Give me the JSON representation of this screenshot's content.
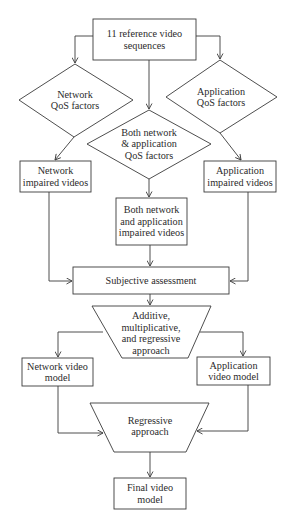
{
  "diagram": {
    "nodes": {
      "reference": {
        "shape": "rectangle",
        "lines": [
          "11 reference video",
          "sequences"
        ]
      },
      "network_qos": {
        "shape": "diamond",
        "lines": [
          "Network",
          "QoS factors"
        ]
      },
      "application_qos": {
        "shape": "diamond",
        "lines": [
          "Application",
          "QoS factors"
        ]
      },
      "both_qos": {
        "shape": "diamond",
        "lines": [
          "Both network",
          "& application",
          "QoS factors"
        ]
      },
      "network_impaired": {
        "shape": "rectangle",
        "lines": [
          "Network",
          "impaired videos"
        ]
      },
      "application_impaired": {
        "shape": "rectangle",
        "lines": [
          "Application",
          "impaired videos"
        ]
      },
      "both_impaired": {
        "shape": "rectangle",
        "lines": [
          "Both network",
          "and application",
          "impaired videos"
        ]
      },
      "subjective": {
        "shape": "rectangle",
        "lines": [
          "Subjective assessment"
        ]
      },
      "additive": {
        "shape": "trapezoid",
        "lines": [
          "Additive,",
          "multiplicative,",
          "and regressive",
          "approach"
        ]
      },
      "network_model": {
        "shape": "rectangle",
        "lines": [
          "Network video",
          "model"
        ]
      },
      "application_model": {
        "shape": "rectangle",
        "lines": [
          "Application",
          "video model"
        ]
      },
      "regressive": {
        "shape": "trapezoid",
        "lines": [
          "Regressive",
          "approach"
        ]
      },
      "final": {
        "shape": "rectangle",
        "lines": [
          "Final video",
          "model"
        ]
      }
    },
    "edges": [
      [
        "reference",
        "network_qos"
      ],
      [
        "reference",
        "both_qos"
      ],
      [
        "reference",
        "application_qos"
      ],
      [
        "network_qos",
        "network_impaired"
      ],
      [
        "both_qos",
        "both_impaired"
      ],
      [
        "application_qos",
        "application_impaired"
      ],
      [
        "network_impaired",
        "subjective"
      ],
      [
        "both_impaired",
        "subjective"
      ],
      [
        "application_impaired",
        "subjective"
      ],
      [
        "subjective",
        "additive"
      ],
      [
        "additive",
        "network_model"
      ],
      [
        "additive",
        "application_model"
      ],
      [
        "network_model",
        "regressive"
      ],
      [
        "application_model",
        "regressive"
      ],
      [
        "regressive",
        "final"
      ]
    ],
    "colors": {
      "stroke": "#3a3a3a",
      "text": "#2b2b2b",
      "background": "#ffffff"
    }
  }
}
